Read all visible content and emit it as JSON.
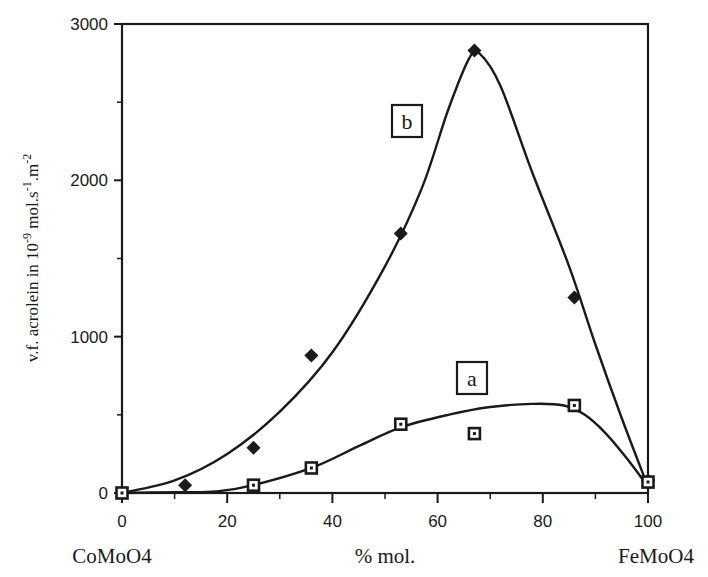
{
  "chart_data": {
    "type": "scatter",
    "title": "",
    "xlabel": "% mol.",
    "ylabel": "v.f. acrolein in 10-9 mol.s-1.m-2",
    "ylabel_parts": {
      "base": "v.f. acrolein in 10",
      "exp1": "-9",
      "mid": " mol.s",
      "exp2": "-1",
      "mid2": ".m",
      "exp3": "-2"
    },
    "x_end_labels": {
      "left": "CoMoO4",
      "right": "FeMoO4"
    },
    "xlim": [
      0,
      100
    ],
    "ylim": [
      0,
      3000
    ],
    "x_ticks": [
      0,
      20,
      40,
      60,
      80,
      100
    ],
    "y_ticks": [
      0,
      1000,
      2000,
      3000
    ],
    "grid": false,
    "series": [
      {
        "name": "b",
        "marker": "filled-diamond",
        "x": [
          0,
          12,
          25,
          36,
          53,
          67,
          86,
          100
        ],
        "values": [
          0,
          50,
          290,
          880,
          1660,
          2830,
          1250,
          80
        ],
        "fit_curve": [
          [
            0,
            0
          ],
          [
            10,
            80
          ],
          [
            20,
            250
          ],
          [
            30,
            520
          ],
          [
            40,
            900
          ],
          [
            50,
            1450
          ],
          [
            57,
            1950
          ],
          [
            62,
            2450
          ],
          [
            66,
            2780
          ],
          [
            68,
            2810
          ],
          [
            72,
            2600
          ],
          [
            78,
            2050
          ],
          [
            85,
            1450
          ],
          [
            90,
            950
          ],
          [
            95,
            480
          ],
          [
            100,
            40
          ]
        ]
      },
      {
        "name": "a",
        "marker": "open-square",
        "x": [
          0,
          25,
          36,
          53,
          67,
          86,
          100
        ],
        "values": [
          0,
          50,
          160,
          440,
          380,
          560,
          70
        ],
        "fit_curve": [
          [
            0,
            0
          ],
          [
            10,
            5
          ],
          [
            18,
            10
          ],
          [
            25,
            50
          ],
          [
            36,
            160
          ],
          [
            45,
            300
          ],
          [
            53,
            420
          ],
          [
            62,
            500
          ],
          [
            70,
            550
          ],
          [
            78,
            570
          ],
          [
            84,
            560
          ],
          [
            88,
            500
          ],
          [
            92,
            380
          ],
          [
            96,
            220
          ],
          [
            100,
            40
          ]
        ]
      }
    ],
    "annotations": [
      {
        "text": "b",
        "x": 53,
        "y": 2350,
        "boxed": true
      },
      {
        "text": "a",
        "x": 67,
        "y": 750,
        "boxed": true
      }
    ]
  },
  "labels": {
    "tick_x": [
      "0",
      "20",
      "40",
      "60",
      "80",
      "100"
    ],
    "tick_y": [
      "0",
      "1000",
      "2000",
      "3000"
    ],
    "xlabel": "% mol.",
    "left_compound": "CoMoO4",
    "right_compound": "FeMoO4",
    "label_a": "a",
    "label_b": "b"
  }
}
